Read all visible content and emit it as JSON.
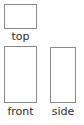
{
  "diagram": {
    "title": "",
    "background_color": "#ffffff",
    "line_color": "#8a8a8a",
    "label_color": "#2e2e2e",
    "views": [
      {
        "name": "top",
        "label": "top",
        "shape": "rectangle",
        "width_px": 33,
        "height_px": 25,
        "x_px": 4,
        "y_px": 4
      },
      {
        "name": "front",
        "label": "front",
        "shape": "rectangle",
        "width_px": 33,
        "height_px": 57,
        "x_px": 4,
        "y_px": 46
      },
      {
        "name": "side",
        "label": "side",
        "shape": "rectangle",
        "width_px": 26,
        "height_px": 56,
        "x_px": 50,
        "y_px": 47
      }
    ]
  }
}
